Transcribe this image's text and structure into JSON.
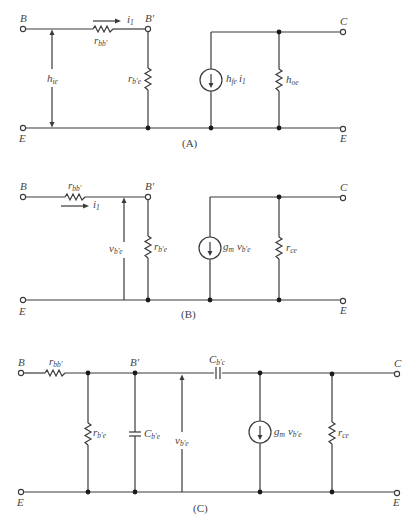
{
  "figure": {
    "colors": {
      "line": "#3a3a3a",
      "text": "#444444",
      "background": "#ffffff"
    },
    "circuits": [
      {
        "id": "A",
        "caption": "(A)",
        "terminals": {
          "input_top": "B",
          "internal": "B'",
          "input_bottom": "E",
          "output_top": "C",
          "output_bottom": "E"
        },
        "components": {
          "series_resistor": {
            "symbol": "r",
            "sub": "bb'"
          },
          "current_label": {
            "symbol": "i",
            "sub": "1"
          },
          "input_quantity": {
            "symbol": "h",
            "sub": "ie"
          },
          "shunt_resistor": {
            "symbol": "r",
            "sub": "b'e"
          },
          "current_source": {
            "symbol": "h",
            "sub": "fe",
            "suffix": "i",
            "suffix_sub": "1"
          },
          "output_element": {
            "symbol": "h",
            "sub": "oe"
          }
        }
      },
      {
        "id": "B",
        "caption": "(B)",
        "terminals": {
          "input_top": "B",
          "internal": "B'",
          "input_bottom": "E",
          "output_top": "C",
          "output_bottom": "E"
        },
        "components": {
          "series_resistor": {
            "symbol": "r",
            "sub": "bb'"
          },
          "current_label": {
            "symbol": "i",
            "sub": "1"
          },
          "voltage_label": {
            "symbol": "v",
            "sub": "b'e"
          },
          "shunt_resistor": {
            "symbol": "r",
            "sub": "b'e"
          },
          "current_source": {
            "symbol": "g",
            "sub": "m",
            "suffix": "v",
            "suffix_sub": "b'e"
          },
          "output_resistor": {
            "symbol": "r",
            "sub": "ce"
          }
        }
      },
      {
        "id": "C",
        "caption": "(C)",
        "terminals": {
          "input_top": "B",
          "internal": "B'",
          "input_bottom": "E",
          "output_top": "C",
          "output_bottom": "E"
        },
        "components": {
          "series_resistor": {
            "symbol": "r",
            "sub": "bb'"
          },
          "shunt_resistor": {
            "symbol": "r",
            "sub": "b'e"
          },
          "shunt_capacitor": {
            "symbol": "C",
            "sub": "b'e"
          },
          "voltage_label": {
            "symbol": "v",
            "sub": "b'e"
          },
          "feedback_capacitor": {
            "symbol": "C",
            "sub": "b'c"
          },
          "current_source": {
            "symbol": "g",
            "sub": "m",
            "suffix": "v",
            "suffix_sub": "b'e"
          },
          "output_resistor": {
            "symbol": "r",
            "sub": "ce"
          }
        }
      }
    ]
  }
}
